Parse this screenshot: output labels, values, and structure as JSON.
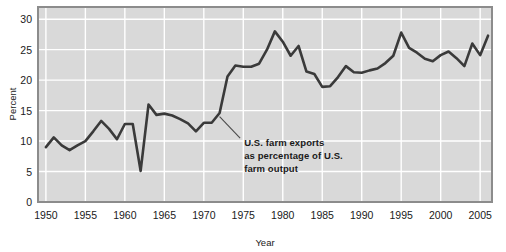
{
  "chart_data": {
    "type": "line",
    "title": "",
    "xlabel": "Year",
    "ylabel": "Percent",
    "xlim": [
      1949,
      2006.5
    ],
    "ylim": [
      0,
      32
    ],
    "grid": true,
    "legend": "none",
    "annotations": [
      {
        "name": "series-callout",
        "lines": [
          "U.S. farm exports",
          "as percentage of U.S.",
          "farm output"
        ],
        "text": "U.S. farm exports as percentage of U.S. farm output",
        "leader_from_x": 1972.0,
        "leader_from_y": 14.0,
        "leader_to_x": 1974.6,
        "leader_to_y": 10.5
      }
    ],
    "xticks": [
      1950,
      1955,
      1960,
      1965,
      1970,
      1975,
      1980,
      1985,
      1990,
      1995,
      2000,
      2005
    ],
    "xticklabels": [
      "1950",
      "1955",
      "1960",
      "1965",
      "1970",
      "1975",
      "1980",
      "1985",
      "1990",
      "1995",
      "2000",
      "2005"
    ],
    "yticks": [
      0,
      5,
      10,
      15,
      20,
      25,
      30
    ],
    "yticklabels": [
      "0",
      "5",
      "10",
      "15",
      "20",
      "25",
      "30"
    ],
    "series": [
      {
        "name": "U.S. farm exports as percentage of U.S. farm output",
        "color": "#3a3a3a",
        "x": [
          1950,
          1951,
          1952,
          1953,
          1954,
          1955,
          1956,
          1957,
          1958,
          1959,
          1960,
          1961,
          1962,
          1963,
          1964,
          1965,
          1966,
          1967,
          1968,
          1969,
          1970,
          1971,
          1972,
          1973,
          1974,
          1975,
          1976,
          1977,
          1978,
          1979,
          1980,
          1981,
          1982,
          1983,
          1984,
          1985,
          1986,
          1987,
          1988,
          1989,
          1990,
          1991,
          1992,
          1993,
          1994,
          1995,
          1996,
          1997,
          1998,
          1999,
          2000,
          2001,
          2002,
          2003,
          2004,
          2005,
          2006
        ],
        "values": [
          9.0,
          10.6,
          9.3,
          8.5,
          9.3,
          10.0,
          11.6,
          13.3,
          12.0,
          10.3,
          12.8,
          12.8,
          5.1,
          16.0,
          14.3,
          14.5,
          14.2,
          13.6,
          12.9,
          11.6,
          13.0,
          13.0,
          14.6,
          20.6,
          22.4,
          22.2,
          22.2,
          22.7,
          25.0,
          28.0,
          26.3,
          24.0,
          25.6,
          21.4,
          21.0,
          18.9,
          19.0,
          20.5,
          22.3,
          21.3,
          21.2,
          21.6,
          21.9,
          22.8,
          24.0,
          27.8,
          25.3,
          24.5,
          23.5,
          23.1,
          24.1,
          24.7,
          23.6,
          22.3,
          26.0,
          24.1,
          27.3
        ]
      }
    ]
  },
  "axes": {
    "ylabel": "Percent",
    "xlabel": "Year"
  }
}
